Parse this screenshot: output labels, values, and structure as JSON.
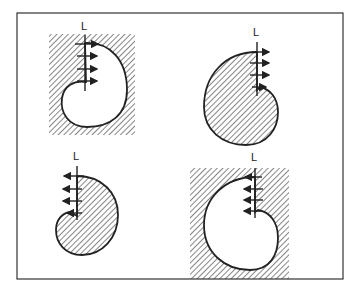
{
  "figure": {
    "colors": {
      "ink": "#222222",
      "background": "#ffffff"
    },
    "panels": [
      {
        "id": "top-left",
        "label": "L",
        "shape_fill": "white",
        "background": "hatched",
        "arrow_direction": "right",
        "arrow_count": 4
      },
      {
        "id": "top-right",
        "label": "L",
        "shape_fill": "hatched",
        "background": "white",
        "arrow_direction": "right",
        "arrow_count": 4
      },
      {
        "id": "bottom-left",
        "label": "L",
        "shape_fill": "hatched",
        "background": "white",
        "arrow_direction": "left",
        "arrow_count": 4
      },
      {
        "id": "bottom-right",
        "label": "L",
        "shape_fill": "white",
        "background": "hatched",
        "arrow_direction": "left",
        "arrow_count": 4
      }
    ]
  }
}
